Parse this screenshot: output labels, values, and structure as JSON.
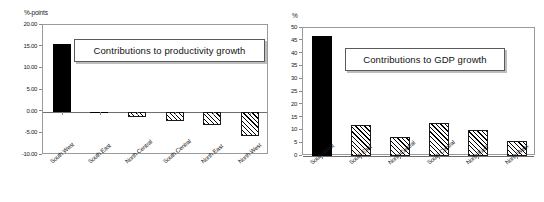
{
  "figure": {
    "width": 544,
    "height": 202,
    "background": "#ffffff"
  },
  "chart_data": [
    {
      "id": "productivity",
      "type": "bar",
      "title": "Contributions to productivity growth",
      "xlabel": "",
      "ylabel": "%-points",
      "unit_label": "%-points",
      "categories": [
        "South West",
        "South East",
        "North Central",
        "South Central",
        "North East",
        "North West"
      ],
      "values": [
        15.7,
        -0.3,
        -1.2,
        -2.1,
        -3.0,
        -5.6
      ],
      "value_labels": [
        "15.70",
        "-0.30",
        "-1.20",
        "-2.10",
        "-3.00",
        "-5.60"
      ],
      "bar_styles": [
        "solid",
        "solid",
        "hatch",
        "hatch",
        "hatch",
        "hatch"
      ],
      "ylim": [
        -10.0,
        20.0
      ],
      "yticks": [
        20.0,
        15.0,
        10.0,
        5.0,
        0.0,
        -5.0,
        -10.0
      ],
      "ytick_labels": [
        "20.00",
        "15.00",
        "10.00",
        "5.00",
        "0.00",
        "-5.00",
        "-10.00"
      ],
      "grid": false,
      "legend": "none",
      "colors": {
        "solid_bar": "#000000",
        "hatch_bar_edge": "#1a1a1a",
        "hatch_bar_fill": "#ffffff",
        "axis": "#8a8a8a",
        "frame": "#9a9a9a",
        "text": "#1a1a1a"
      }
    },
    {
      "id": "gdp",
      "type": "bar",
      "title": "Contributions to GDP growth",
      "xlabel": "",
      "ylabel": "%",
      "unit_label": "%",
      "categories": [
        "South West",
        "South East",
        "North Central",
        "South Central",
        "North East",
        "North West"
      ],
      "values": [
        47.0,
        12.0,
        7.5,
        13.0,
        10.0,
        6.0
      ],
      "value_labels": [
        "47",
        "12",
        "7.5",
        "13",
        "10",
        "6"
      ],
      "bar_styles": [
        "solid",
        "hatch",
        "hatch",
        "hatch",
        "hatch",
        "hatch"
      ],
      "ylim": [
        0,
        50
      ],
      "yticks": [
        50,
        45,
        40,
        35,
        30,
        25,
        20,
        15,
        10,
        5,
        0
      ],
      "ytick_labels": [
        "50",
        "45",
        "40",
        "35",
        "30",
        "25",
        "20",
        "15",
        "10",
        "5",
        "0"
      ],
      "grid": false,
      "legend": "none",
      "colors": {
        "solid_bar": "#000000",
        "hatch_bar_edge": "#1a1a1a",
        "hatch_bar_fill": "#ffffff",
        "axis": "#8a8a8a",
        "frame": "#9a9a9a",
        "text": "#1a1a1a"
      }
    }
  ]
}
